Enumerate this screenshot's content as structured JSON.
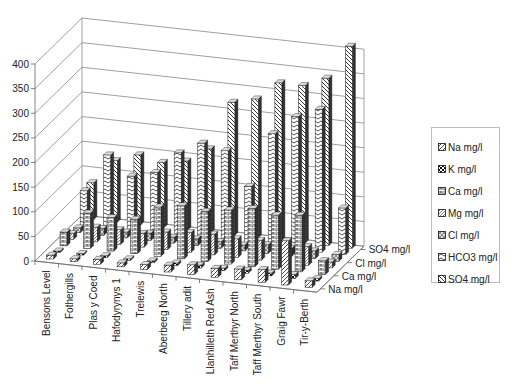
{
  "chart_data": {
    "type": "bar",
    "subtype": "3d-clustered-column",
    "title": "",
    "xlabel": "",
    "ylabel": "",
    "ylim": [
      0,
      400
    ],
    "yticks": [
      0,
      50,
      100,
      150,
      200,
      250,
      300,
      350,
      400
    ],
    "grid": true,
    "legend_position": "right",
    "categories": [
      "Bensons Level",
      "Fothergills",
      "Plas y Coed",
      "Hafodyrynys 1",
      "Trelewis",
      "Aberbeeg North",
      "Tillery adit",
      "Llanhilleth Red Ash",
      "Taff Merthyr North",
      "Taff Merthyr South",
      "Graig Fawr",
      "Tir-y-Berth"
    ],
    "depth_axis_labels": [
      "Na mg/l",
      "Ca mg/l",
      "Cl mg/l",
      "SO4 mg/l"
    ],
    "series": [
      {
        "name": "Na mg/l",
        "values": [
          8,
          6,
          10,
          8,
          10,
          14,
          20,
          18,
          22,
          26,
          90,
          14
        ]
      },
      {
        "name": "K mg/l",
        "values": [
          3,
          3,
          4,
          3,
          4,
          5,
          6,
          5,
          6,
          6,
          8,
          5
        ]
      },
      {
        "name": "Ca mg/l",
        "values": [
          28,
          72,
          68,
          70,
          100,
          108,
          102,
          110,
          118,
          110,
          115,
          28
        ]
      },
      {
        "name": "Mg  mg/l",
        "values": [
          12,
          30,
          30,
          28,
          36,
          40,
          42,
          38,
          40,
          38,
          38,
          12
        ]
      },
      {
        "name": "Cl mg/l",
        "values": [
          10,
          14,
          12,
          15,
          12,
          14,
          14,
          12,
          18,
          16,
          16,
          14
        ]
      },
      {
        "name": "HCO3 mg/l",
        "values": [
          72,
          150,
          112,
          125,
          170,
          195,
          185,
          118,
          230,
          270,
          290,
          95
        ]
      },
      {
        "name": "SO4 mg/l",
        "values": [
          75,
          125,
          142,
          132,
          140,
          170,
          270,
          282,
          320,
          320,
          340,
          410
        ]
      }
    ]
  },
  "legend": {
    "items": [
      {
        "label": "Na mg/l"
      },
      {
        "label": "K mg/l"
      },
      {
        "label": "Ca mg/l"
      },
      {
        "label": "Mg  mg/l"
      },
      {
        "label": "Cl mg/l"
      },
      {
        "label": "HCO3 mg/l"
      },
      {
        "label": "SO4 mg/l"
      }
    ]
  }
}
